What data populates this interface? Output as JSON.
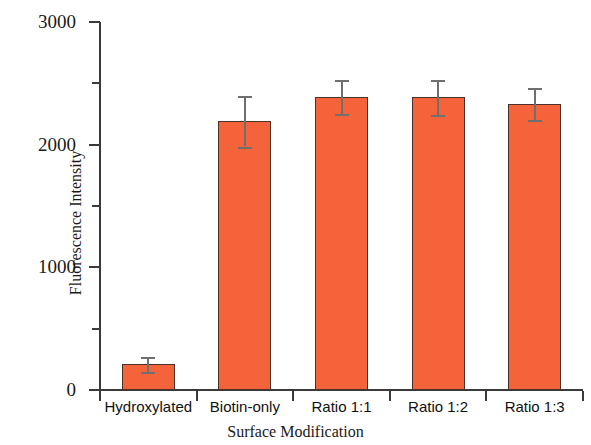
{
  "chart_data": {
    "type": "bar",
    "title": "",
    "xlabel": "Surface Modification",
    "ylabel": "Fluorescence Intensity",
    "categories": [
      "Hydroxylated",
      "Biotin-only",
      "Ratio 1:1",
      "Ratio 1:2",
      "Ratio 1:3"
    ],
    "values": [
      210,
      2190,
      2390,
      2385,
      2330
    ],
    "errors": [
      60,
      205,
      140,
      145,
      130
    ],
    "ylim": [
      0,
      3000
    ],
    "ytick_labels": [
      "0",
      "1000",
      "2000",
      "3000"
    ],
    "ytick_values": [
      0,
      1000,
      2000,
      3000
    ],
    "yminor_tick_values": [
      500,
      1500,
      2500
    ],
    "grid": false,
    "legend": "none",
    "bar_color": "#F4633A",
    "bar_edge_color": "#4a3028",
    "error_color": "#6f6f6f",
    "axis_color": "#3a3a3a"
  }
}
